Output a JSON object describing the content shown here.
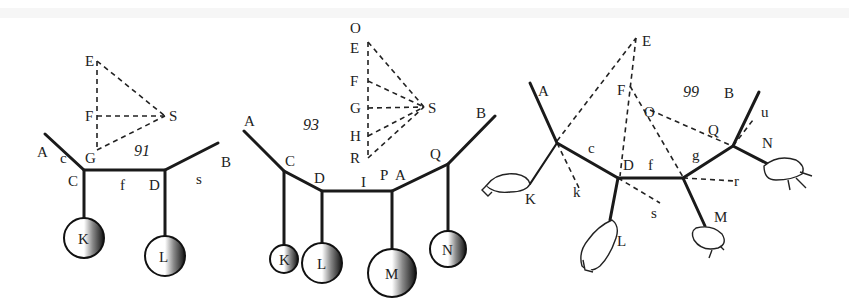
{
  "figures": [
    {
      "number": "91",
      "points": {
        "A": "A",
        "c": "c",
        "C": "C",
        "G": "G",
        "E": "E",
        "F": "F",
        "S": "S",
        "f": "f",
        "D": "D",
        "s": "s",
        "B": "B"
      },
      "weights": [
        "K",
        "L"
      ]
    },
    {
      "number": "93",
      "points": {
        "A_left": "A",
        "C": "C",
        "D": "D",
        "I": "I",
        "P": "P",
        "A_right": "A",
        "Q": "Q",
        "B": "B",
        "O": "O",
        "E": "E",
        "F": "F",
        "G": "G",
        "H": "H",
        "R": "R",
        "S": "S"
      },
      "weights": [
        "K",
        "L",
        "M",
        "N"
      ]
    },
    {
      "number": "99",
      "points": {
        "A": "A",
        "E": "E",
        "F": "F",
        "O": "O",
        "c": "c",
        "D": "D",
        "f": "f",
        "g": "g",
        "Q": "Q",
        "B": "B",
        "u": "u",
        "N": "N",
        "r": "r",
        "k": "k",
        "s": "s"
      },
      "hands": [
        "K",
        "L",
        "M",
        "N"
      ]
    }
  ],
  "colors": {
    "ink": "#1a1a1a",
    "paper": "#ffffff"
  }
}
